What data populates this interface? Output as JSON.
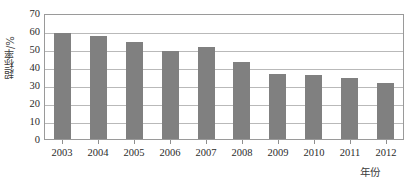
{
  "chart_data": {
    "type": "bar",
    "title": "",
    "subtitle": "",
    "xlabel": "年份",
    "ylabel": "超标率/%",
    "categories": [
      "2003",
      "2004",
      "2005",
      "2006",
      "2007",
      "2008",
      "2009",
      "2010",
      "2011",
      "2012"
    ],
    "values": [
      59,
      57.5,
      54,
      49,
      51,
      43,
      36,
      35.5,
      34,
      31
    ],
    "series": [
      {
        "name": "超标率",
        "values": [
          59,
          57.5,
          54,
          49,
          51,
          43,
          36,
          35.5,
          34,
          31
        ]
      }
    ],
    "ylim": [
      0,
      70
    ],
    "ytick_step": 10,
    "yticks": [
      70,
      60,
      50,
      40,
      30,
      20,
      10,
      0
    ],
    "ytick_labels": [
      "70",
      "60",
      "50",
      "40",
      "30",
      "20",
      "10",
      "0"
    ],
    "xlim_categories": 10,
    "grid": true,
    "grid_axis": "y",
    "legend": false,
    "legend_position": "none",
    "annotations": [],
    "colors": {
      "bar_fill": "#808080",
      "gridline": "#b9b9b9",
      "frame": "#9a9a9a",
      "text": "#2b2b2b",
      "background": "#ffffff"
    }
  }
}
